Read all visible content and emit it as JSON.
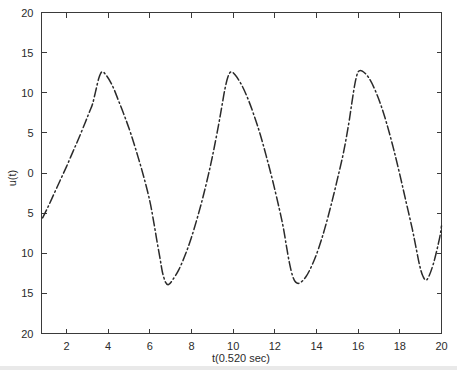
{
  "figure": {
    "background_color": "#ffffff",
    "line_color": "#2a2a2a",
    "axis_color": "#3a3a3a",
    "line_style": "dash-dot"
  },
  "chart_data": {
    "type": "line",
    "title": "",
    "subtitle": "",
    "xlabel": "t(0.520 sec)",
    "ylabel": "u(t)",
    "xlim": [
      0.8,
      20
    ],
    "ylim": [
      -20,
      20
    ],
    "grid": false,
    "legend": [],
    "legend_position": "none",
    "xticks": [
      2,
      4,
      6,
      8,
      10,
      12,
      14,
      16,
      18,
      20
    ],
    "xtick_labels": [
      "2",
      "4",
      "6",
      "8",
      "10",
      "12",
      "14",
      "16",
      "18",
      "20"
    ],
    "yticks": [
      20,
      15,
      10,
      5,
      0,
      -5,
      -10,
      -15,
      -20
    ],
    "ytick_labels": [
      "20",
      "15",
      "10",
      "5",
      "0",
      "5",
      "10",
      "15",
      "20"
    ],
    "annotations": [
      "Periodic oscillation, period approximately 6.1 units",
      "Positive peaks approximately 12.7, negative troughs approximately -13.9"
    ],
    "series": [
      {
        "name": "u(t)",
        "style": "dash-dot",
        "color": "#2a2a2a",
        "x": [
          0.85,
          1.1,
          1.4,
          1.7,
          2.0,
          2.3,
          2.6,
          2.9,
          3.1,
          3.25,
          3.4,
          3.55,
          3.7,
          3.9,
          4.2,
          4.5,
          4.8,
          5.1,
          5.4,
          5.7,
          6.0,
          6.2,
          6.35,
          6.5,
          6.6,
          6.75,
          6.9,
          7.1,
          7.4,
          7.7,
          8.0,
          8.3,
          8.6,
          8.9,
          9.1,
          9.3,
          9.45,
          9.6,
          9.75,
          9.9,
          10.1,
          10.4,
          10.7,
          11.0,
          11.3,
          11.6,
          11.9,
          12.2,
          12.4,
          12.55,
          12.7,
          12.85,
          13.0,
          13.2,
          13.5,
          13.8,
          14.1,
          14.4,
          14.7,
          15.0,
          15.3,
          15.55,
          15.7,
          15.85,
          16.0,
          16.2,
          16.5,
          16.8,
          17.1,
          17.4,
          17.7,
          18.0,
          18.3,
          18.6,
          18.8,
          18.95,
          19.1,
          19.3,
          19.6,
          19.9,
          20.0
        ],
        "y": [
          -5.6,
          -4.3,
          -2.6,
          -0.9,
          0.8,
          2.6,
          4.4,
          6.3,
          7.6,
          8.6,
          10.2,
          11.8,
          12.6,
          12.2,
          10.9,
          9.0,
          7.0,
          4.8,
          2.3,
          -0.4,
          -3.5,
          -6.3,
          -8.6,
          -10.8,
          -12.3,
          -13.6,
          -13.9,
          -13.3,
          -12.0,
          -10.2,
          -8.0,
          -5.4,
          -2.5,
          0.8,
          3.3,
          6.0,
          8.2,
          10.4,
          12.0,
          12.6,
          12.2,
          11.0,
          9.3,
          7.2,
          4.8,
          2.0,
          -1.0,
          -4.3,
          -6.7,
          -9.0,
          -11.2,
          -12.8,
          -13.6,
          -13.7,
          -12.9,
          -11.4,
          -9.4,
          -6.9,
          -4.0,
          -0.8,
          2.6,
          6.2,
          8.8,
          11.2,
          12.6,
          12.7,
          11.9,
          10.4,
          8.4,
          5.9,
          3.0,
          -0.2,
          -3.6,
          -7.0,
          -9.6,
          -11.5,
          -12.8,
          -13.3,
          -11.4,
          -8.2,
          -6.6
        ]
      }
    ]
  }
}
